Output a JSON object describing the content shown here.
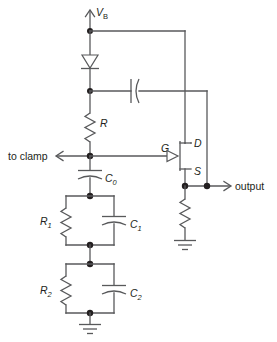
{
  "diagram": {
    "type": "electronic-schematic",
    "background_color": "#ffffff",
    "line_color": "#58595b",
    "node_color": "#231f20",
    "text_color": "#231f20"
  },
  "labels": {
    "supply": "V",
    "supply_sub": "B",
    "resistor_r": "R",
    "cap_c0": "C",
    "cap_c0_sub": "0",
    "resistor_r1": "R",
    "resistor_r1_sub": "1",
    "cap_c1": "C",
    "cap_c1_sub": "1",
    "resistor_r2": "R",
    "resistor_r2_sub": "2",
    "cap_c2": "C",
    "cap_c2_sub": "2",
    "gate": "G",
    "drain": "D",
    "source": "S",
    "to_clamp": "to clamp",
    "output": "output"
  },
  "components": [
    {
      "id": "vb-terminal",
      "name": "supply-terminal",
      "label": "V_B",
      "kind": "terminal-arrow-up"
    },
    {
      "id": "d1",
      "name": "diode",
      "label": "",
      "kind": "diode-down"
    },
    {
      "id": "cf",
      "name": "feedback-capacitor",
      "label": "",
      "kind": "capacitor-polarized-horizontal"
    },
    {
      "id": "r",
      "name": "resistor-r",
      "label": "R",
      "kind": "resistor-vertical"
    },
    {
      "id": "c0",
      "name": "capacitor-c0",
      "label": "C0",
      "kind": "capacitor-polarized-vertical"
    },
    {
      "id": "r1",
      "name": "resistor-r1",
      "label": "R1",
      "kind": "resistor-vertical"
    },
    {
      "id": "c1",
      "name": "capacitor-c1",
      "label": "C1",
      "kind": "capacitor-polarized-vertical"
    },
    {
      "id": "r2",
      "name": "resistor-r2",
      "label": "R2",
      "kind": "resistor-vertical"
    },
    {
      "id": "c2",
      "name": "capacitor-c2",
      "label": "C2",
      "kind": "capacitor-polarized-vertical"
    },
    {
      "id": "q1",
      "name": "fet-transistor",
      "label": "",
      "kind": "n-channel-jfet",
      "pins": [
        "G",
        "D",
        "S"
      ]
    },
    {
      "id": "rs",
      "name": "source-resistor",
      "label": "",
      "kind": "resistor-vertical"
    },
    {
      "id": "gnd1",
      "name": "ground-source",
      "label": "",
      "kind": "ground"
    },
    {
      "id": "gnd2",
      "name": "ground-divider",
      "label": "",
      "kind": "ground"
    },
    {
      "id": "clamp-port",
      "name": "to-clamp-port",
      "label": "to clamp",
      "kind": "arrow-left-port"
    },
    {
      "id": "output-port",
      "name": "output-port",
      "label": "output",
      "kind": "arrow-right-port"
    }
  ],
  "nodes": [
    {
      "name": "node-supply",
      "x": 90,
      "y": 31
    },
    {
      "name": "node-diode-out",
      "x": 90,
      "y": 91
    },
    {
      "name": "node-clamp",
      "x": 90,
      "y": 156
    },
    {
      "name": "node-divider-1",
      "x": 90,
      "y": 196
    },
    {
      "name": "node-divider-2",
      "x": 90,
      "y": 245
    },
    {
      "name": "node-divider-3",
      "x": 90,
      "y": 313
    },
    {
      "name": "node-source",
      "x": 185,
      "y": 186
    },
    {
      "name": "node-output",
      "x": 207,
      "y": 186
    }
  ]
}
